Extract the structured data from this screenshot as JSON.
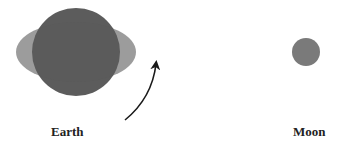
{
  "diagram": {
    "labels": {
      "earth": "Earth",
      "moon": "Moon"
    },
    "colors": {
      "earth_body": "#3f3f3f",
      "tidal_bulge": "#6e6e6e",
      "moon": "#7a7a7a",
      "arrow": "#1a1a1a",
      "label": "#222222"
    },
    "elements": [
      {
        "id": "earth-circle",
        "shape": "circle",
        "cx": 76,
        "cy": 52,
        "r": 44
      },
      {
        "id": "tidal-bulge-ellipse",
        "shape": "ellipse",
        "cx": 76,
        "cy": 52,
        "rx": 60,
        "ry": 30
      },
      {
        "id": "rotation-arrow",
        "shape": "curved-arrow",
        "from": [
          125,
          120
        ],
        "to": [
          157,
          62
        ]
      },
      {
        "id": "moon-circle",
        "shape": "circle",
        "cx": 306,
        "cy": 52,
        "r": 14
      }
    ]
  }
}
